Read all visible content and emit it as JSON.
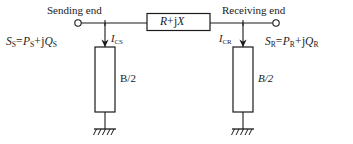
{
  "diagram": {
    "background_color": "#ffffff",
    "line_color": "#1a1a1a",
    "sending": {
      "terminal_label": "Sending end",
      "power_expr": {
        "s_symbol": "S",
        "s_sub": "S",
        "equals": "=",
        "p_symbol": "P",
        "p_sub": "S",
        "plus": "+",
        "j_symbol": "j",
        "q_symbol": "Q",
        "q_sub": "S"
      },
      "current": {
        "symbol": "I",
        "sub": "CS"
      },
      "shunt_label": "B/2",
      "shunt_label_style": "upright"
    },
    "series": {
      "r_symbol": "R",
      "plus": "+",
      "j_symbol": "j",
      "x_symbol": "X"
    },
    "receiving": {
      "terminal_label": "Receiving end",
      "power_expr": {
        "s_symbol": "S",
        "s_sub": "R",
        "equals": "=",
        "p_symbol": "P",
        "p_sub": "R",
        "plus": "+",
        "j_symbol": "j",
        "q_symbol": "Q",
        "q_sub": "R"
      },
      "current": {
        "symbol": "I",
        "sub": "CR"
      },
      "shunt_label": "B/2",
      "shunt_label_style": "italic"
    },
    "ground": {
      "name": "earth-ground",
      "count": 2
    }
  }
}
